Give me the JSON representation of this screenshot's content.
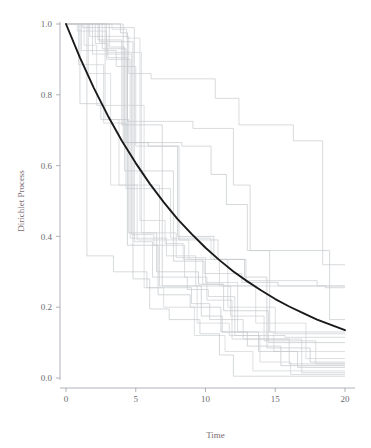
{
  "figure": {
    "background_color": "#ffffff",
    "mean_curve_color": "#1a1a1a",
    "axis_color": "#9aa0a6",
    "label_color": "#7a6a72"
  },
  "axes": {
    "x_title": "Time",
    "y_title": "Dirichlet Process",
    "x_ticks": [
      "0",
      "5",
      "10",
      "15",
      "20"
    ],
    "y_ticks": [
      "0.0",
      "0.2",
      "0.4",
      "0.6",
      "0.8",
      "1.0"
    ]
  },
  "chart_data": {
    "type": "line",
    "title": "",
    "subtitle": "",
    "xlabel": "Time",
    "ylabel": "Dirichlet Process",
    "xlim": [
      0,
      20
    ],
    "ylim": [
      0.0,
      1.0
    ],
    "xticks": [
      0,
      5,
      10,
      15,
      20
    ],
    "yticks": [
      0.0,
      0.2,
      0.4,
      0.6,
      0.8,
      1.0
    ],
    "grid": false,
    "legend": "none",
    "annotations": [],
    "series": [
      {
        "name": "mean",
        "kind": "smooth",
        "color": "#1a1a1a",
        "width": 1.9,
        "formula": "exp(-t/10)",
        "x": [
          0,
          1,
          2,
          3,
          4,
          5,
          6,
          7,
          8,
          9,
          10,
          11,
          12,
          13,
          14,
          15,
          16,
          17,
          18,
          19,
          20
        ],
        "values": [
          1.0,
          0.905,
          0.819,
          0.741,
          0.67,
          0.607,
          0.549,
          0.497,
          0.449,
          0.407,
          0.368,
          0.333,
          0.301,
          0.273,
          0.247,
          0.223,
          0.202,
          0.183,
          0.165,
          0.15,
          0.135
        ]
      },
      {
        "name": "path-1",
        "kind": "step",
        "color": "#c9cccf",
        "x": [
          0,
          1.7,
          1.7,
          4.5,
          4.5,
          6.1,
          6.1,
          10.7,
          10.7,
          12.4,
          12.4,
          16.3,
          16.3,
          18.4,
          18.4,
          20
        ],
        "values": [
          1.0,
          1.0,
          0.965,
          0.965,
          0.86,
          0.86,
          0.845,
          0.845,
          0.79,
          0.79,
          0.715,
          0.715,
          0.67,
          0.67,
          0.32,
          0.32
        ]
      },
      {
        "name": "path-2",
        "kind": "step",
        "color": "#c4c8cb",
        "x": [
          0,
          2.6,
          2.6,
          4.3,
          4.3,
          8.3,
          8.3,
          10.4,
          10.4,
          11.5,
          11.5,
          13.0,
          13.0,
          18.9,
          18.9,
          20
        ],
        "values": [
          1.0,
          1.0,
          0.93,
          0.93,
          0.665,
          0.665,
          0.655,
          0.655,
          0.575,
          0.575,
          0.49,
          0.49,
          0.36,
          0.36,
          0.165,
          0.165
        ]
      },
      {
        "name": "path-3",
        "kind": "step",
        "color": "#c7cacd",
        "x": [
          0,
          2.1,
          2.1,
          3.0,
          3.0,
          4.4,
          4.4,
          9.1,
          9.1,
          12.0,
          12.0,
          13.2,
          13.2,
          14.6,
          14.6,
          20
        ],
        "values": [
          1.0,
          1.0,
          0.945,
          0.945,
          0.905,
          0.905,
          0.725,
          0.725,
          0.705,
          0.705,
          0.545,
          0.545,
          0.36,
          0.36,
          0.13,
          0.13
        ]
      },
      {
        "name": "path-4",
        "kind": "step",
        "color": "#ccd0d3",
        "x": [
          0,
          0.9,
          0.9,
          2.7,
          2.7,
          4.3,
          4.3,
          7.5,
          7.5,
          10.4,
          10.4,
          11.6,
          11.6,
          15.0,
          15.0,
          20
        ],
        "values": [
          1.0,
          1.0,
          0.885,
          0.885,
          0.72,
          0.72,
          0.535,
          0.535,
          0.395,
          0.395,
          0.335,
          0.335,
          0.2,
          0.2,
          0.125,
          0.125
        ]
      },
      {
        "name": "path-5",
        "kind": "step",
        "color": "#c2c6c9",
        "x": [
          0,
          1.0,
          1.0,
          2.5,
          2.5,
          4.5,
          4.5,
          6.5,
          6.5,
          9.5,
          9.5,
          11.3,
          11.3,
          14.5,
          14.5,
          20
        ],
        "values": [
          1.0,
          1.0,
          0.775,
          0.775,
          0.73,
          0.73,
          0.41,
          0.41,
          0.3,
          0.3,
          0.265,
          0.265,
          0.19,
          0.19,
          0.1,
          0.1
        ]
      },
      {
        "name": "path-6",
        "kind": "step",
        "color": "#cfd2d5",
        "x": [
          0,
          1.6,
          1.6,
          3.2,
          3.2,
          5.1,
          5.1,
          8.8,
          8.8,
          11.0,
          11.0,
          13.6,
          13.6,
          17.2,
          17.2,
          20
        ],
        "values": [
          1.0,
          1.0,
          0.86,
          0.86,
          0.545,
          0.545,
          0.39,
          0.39,
          0.335,
          0.335,
          0.26,
          0.26,
          0.155,
          0.155,
          0.055,
          0.055
        ]
      },
      {
        "name": "path-7",
        "kind": "step",
        "color": "#c6cacd",
        "x": [
          0,
          1.5,
          1.5,
          3.4,
          3.4,
          5.8,
          5.8,
          9.0,
          9.0,
          10.3,
          10.3,
          12.7,
          12.7,
          16.0,
          16.0,
          20
        ],
        "values": [
          1.0,
          1.0,
          0.345,
          0.345,
          0.3,
          0.3,
          0.255,
          0.255,
          0.21,
          0.21,
          0.165,
          0.165,
          0.11,
          0.11,
          0.04,
          0.04
        ]
      },
      {
        "name": "path-8",
        "kind": "step",
        "color": "#cbcfd2",
        "x": [
          0,
          2.9,
          2.9,
          4.6,
          4.6,
          7.2,
          7.2,
          9.3,
          9.3,
          11.8,
          11.8,
          14.2,
          14.2,
          17.9,
          17.9,
          20
        ],
        "values": [
          1.0,
          1.0,
          0.9,
          0.9,
          0.395,
          0.395,
          0.345,
          0.345,
          0.26,
          0.26,
          0.175,
          0.175,
          0.105,
          0.105,
          0.04,
          0.04
        ]
      },
      {
        "name": "path-9",
        "kind": "step",
        "color": "#c0c4c7",
        "x": [
          0,
          3.9,
          3.9,
          4.4,
          4.4,
          6.6,
          6.6,
          8.9,
          8.9,
          11.1,
          11.1,
          13.0,
          13.0,
          15.4,
          15.4,
          20
        ],
        "values": [
          1.0,
          1.0,
          0.975,
          0.975,
          0.375,
          0.375,
          0.235,
          0.235,
          0.2,
          0.2,
          0.13,
          0.13,
          0.09,
          0.09,
          0.035,
          0.035
        ]
      },
      {
        "name": "path-10",
        "kind": "step",
        "color": "#ced1d4",
        "x": [
          0,
          0.8,
          0.8,
          2.9,
          2.9,
          5.4,
          5.4,
          7.9,
          7.9,
          10.0,
          10.0,
          12.3,
          12.3,
          14.9,
          14.9,
          20
        ],
        "values": [
          1.0,
          1.0,
          0.98,
          0.98,
          0.92,
          0.92,
          0.41,
          0.41,
          0.34,
          0.34,
          0.27,
          0.27,
          0.13,
          0.13,
          0.075,
          0.075
        ]
      },
      {
        "name": "path-11",
        "kind": "step",
        "color": "#c3c7ca",
        "x": [
          0,
          2.3,
          2.3,
          4.0,
          4.0,
          6.9,
          6.9,
          9.7,
          9.7,
          11.2,
          11.2,
          13.8,
          13.8,
          16.6,
          16.6,
          20
        ],
        "values": [
          1.0,
          1.0,
          0.955,
          0.955,
          0.715,
          0.715,
          0.26,
          0.26,
          0.175,
          0.175,
          0.13,
          0.13,
          0.075,
          0.075,
          0.03,
          0.03
        ]
      },
      {
        "name": "path-12",
        "kind": "step",
        "color": "#c8cccf",
        "x": [
          0,
          1.1,
          1.1,
          3.6,
          3.6,
          5.0,
          5.0,
          8.1,
          8.1,
          10.9,
          10.9,
          12.9,
          12.9,
          18.0,
          18.0,
          20
        ],
        "values": [
          1.0,
          1.0,
          0.925,
          0.925,
          0.88,
          0.88,
          0.655,
          0.655,
          0.39,
          0.39,
          0.335,
          0.335,
          0.275,
          0.275,
          0.26,
          0.26
        ]
      },
      {
        "name": "path-13",
        "kind": "step",
        "color": "#cacdd0",
        "x": [
          0,
          1.9,
          1.9,
          4.7,
          4.7,
          6.3,
          6.3,
          8.5,
          8.5,
          10.1,
          10.1,
          11.9,
          11.9,
          16.9,
          16.9,
          20
        ],
        "values": [
          1.0,
          1.0,
          0.915,
          0.915,
          0.405,
          0.405,
          0.375,
          0.375,
          0.285,
          0.285,
          0.22,
          0.22,
          0.11,
          0.11,
          0.015,
          0.015
        ]
      },
      {
        "name": "path-14",
        "kind": "step",
        "color": "#c5c9cc",
        "x": [
          0,
          3.1,
          3.1,
          4.2,
          4.2,
          7.7,
          7.7,
          9.9,
          9.9,
          12.6,
          12.6,
          15.2,
          15.2,
          18.6,
          18.6,
          20
        ],
        "values": [
          1.0,
          1.0,
          0.935,
          0.935,
          0.585,
          0.585,
          0.33,
          0.33,
          0.295,
          0.295,
          0.27,
          0.27,
          0.26,
          0.26,
          0.255,
          0.255
        ]
      },
      {
        "name": "path-15",
        "kind": "step",
        "color": "#d0d3d6",
        "x": [
          0,
          1.3,
          1.3,
          2.2,
          2.2,
          5.6,
          5.6,
          7.0,
          7.0,
          9.2,
          9.2,
          11.4,
          11.4,
          13.4,
          13.4,
          20
        ],
        "values": [
          1.0,
          1.0,
          0.94,
          0.94,
          0.77,
          0.77,
          0.255,
          0.255,
          0.2,
          0.2,
          0.12,
          0.12,
          0.075,
          0.075,
          0.02,
          0.02
        ]
      },
      {
        "name": "path-16",
        "kind": "step",
        "color": "#c1c5c8",
        "x": [
          0,
          4.1,
          4.1,
          5.9,
          5.9,
          8.0,
          8.0,
          10.6,
          10.6,
          12.8,
          12.8,
          14.4,
          14.4,
          17.5,
          17.5,
          20
        ],
        "values": [
          1.0,
          1.0,
          0.665,
          0.665,
          0.655,
          0.655,
          0.4,
          0.4,
          0.335,
          0.335,
          0.285,
          0.285,
          0.085,
          0.085,
          0.045,
          0.045
        ]
      },
      {
        "name": "path-17",
        "kind": "step",
        "color": "#cdd0d3",
        "x": [
          0,
          2.8,
          2.8,
          3.8,
          3.8,
          6.7,
          6.7,
          9.4,
          9.4,
          11.7,
          11.7,
          13.9,
          13.9,
          16.1,
          16.1,
          20
        ],
        "values": [
          1.0,
          1.0,
          0.73,
          0.73,
          0.545,
          0.545,
          0.26,
          0.26,
          0.155,
          0.155,
          0.12,
          0.12,
          0.045,
          0.045,
          0.01,
          0.01
        ]
      },
      {
        "name": "path-18",
        "kind": "step",
        "color": "#c9ccd0",
        "x": [
          0,
          1.2,
          1.2,
          4.9,
          4.9,
          6.2,
          6.2,
          8.7,
          8.7,
          10.2,
          10.2,
          12.1,
          12.1,
          15.7,
          15.7,
          20
        ],
        "values": [
          1.0,
          1.0,
          0.99,
          0.99,
          0.385,
          0.385,
          0.285,
          0.285,
          0.25,
          0.25,
          0.23,
          0.23,
          0.12,
          0.12,
          0.115,
          0.115
        ]
      },
      {
        "name": "path-19",
        "kind": "step",
        "color": "#c4c8cc",
        "x": [
          0,
          2.4,
          2.4,
          4.8,
          4.8,
          6.0,
          6.0,
          7.4,
          7.4,
          9.6,
          9.6,
          11.0,
          11.0,
          12.0,
          12.0,
          20
        ],
        "values": [
          1.0,
          1.0,
          0.95,
          0.95,
          0.28,
          0.28,
          0.195,
          0.195,
          0.165,
          0.165,
          0.125,
          0.125,
          0.065,
          0.065,
          0.005,
          0.005
        ]
      },
      {
        "name": "path-20",
        "kind": "step",
        "color": "#cfd3d6",
        "x": [
          0,
          3.3,
          3.3,
          4.35,
          4.35,
          5.3,
          5.3,
          7.1,
          7.1,
          8.4,
          8.4,
          9.8,
          9.8,
          11.3,
          11.3,
          20
        ],
        "values": [
          1.0,
          1.0,
          0.985,
          0.985,
          0.96,
          0.96,
          0.445,
          0.445,
          0.38,
          0.38,
          0.335,
          0.335,
          0.265,
          0.265,
          0.26,
          0.26
        ]
      }
    ]
  }
}
